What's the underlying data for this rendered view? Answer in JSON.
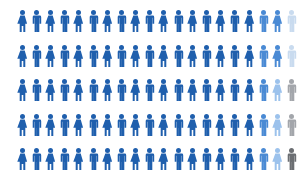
{
  "chart_data": {
    "type": "pictogram",
    "title": "",
    "rows": 5,
    "columns": 20,
    "total_icons": 100,
    "icon_pattern": [
      "female",
      "male"
    ],
    "palette": {
      "D": "#1f5fad",
      "M": "#4a8ad4",
      "L": "#9cc2ec",
      "VL": "#c9dbef",
      "G": "#a3a6ab",
      "DG": "#6b6e72"
    },
    "grid": [
      [
        "D",
        "D",
        "D",
        "D",
        "D",
        "D",
        "D",
        "D",
        "D",
        "D",
        "D",
        "D",
        "D",
        "D",
        "D",
        "D",
        "D",
        "M",
        "M",
        "VL"
      ],
      [
        "D",
        "D",
        "D",
        "D",
        "D",
        "D",
        "D",
        "D",
        "D",
        "D",
        "D",
        "D",
        "D",
        "D",
        "D",
        "D",
        "D",
        "M",
        "M",
        "VL"
      ],
      [
        "D",
        "D",
        "D",
        "D",
        "D",
        "D",
        "D",
        "D",
        "D",
        "D",
        "D",
        "D",
        "D",
        "D",
        "D",
        "D",
        "D",
        "M",
        "L",
        "G"
      ],
      [
        "D",
        "D",
        "D",
        "D",
        "D",
        "D",
        "D",
        "D",
        "D",
        "D",
        "D",
        "D",
        "D",
        "D",
        "D",
        "D",
        "D",
        "M",
        "L",
        "G"
      ],
      [
        "D",
        "D",
        "D",
        "D",
        "D",
        "D",
        "D",
        "D",
        "D",
        "D",
        "D",
        "D",
        "D",
        "D",
        "D",
        "D",
        "D",
        "M",
        "L",
        "DG"
      ]
    ],
    "counts": {
      "D": 85,
      "M": 7,
      "L": 3,
      "VL": 2,
      "G": 2,
      "DG": 1
    }
  }
}
